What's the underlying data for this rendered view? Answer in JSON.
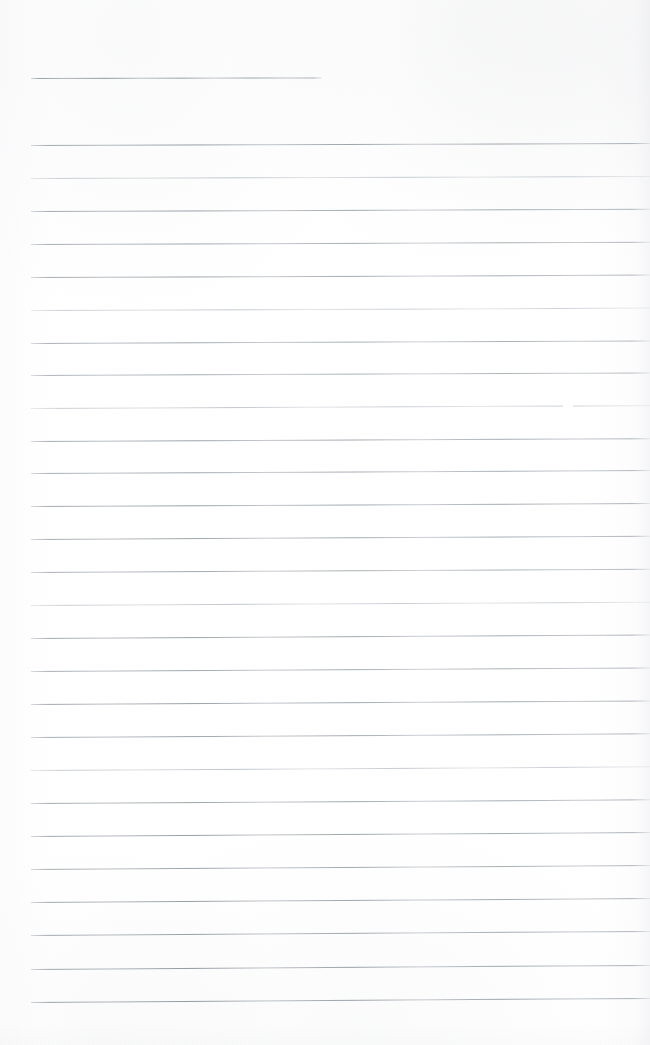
{
  "document": {
    "kind": "scanned-ruled-notebook-page",
    "title": "Blank Ruled Notebook Page",
    "page_width": 650,
    "page_height": 1045,
    "background_color": "#ffffff",
    "rule_color": "#9aa1aa",
    "left_margin_x": 31,
    "right_edge_x": 650,
    "written_text": "",
    "visible_text_content": "none"
  },
  "rules": [
    {
      "top": 78,
      "left": 31,
      "width": 291,
      "skew": -0.1,
      "opacity": 0.95,
      "faint": false
    },
    {
      "top": 145,
      "left": 31,
      "width": 619,
      "skew": -0.18,
      "opacity": 0.92,
      "faint": false
    },
    {
      "top": 178,
      "left": 31,
      "width": 619,
      "skew": -0.18,
      "opacity": 0.8,
      "faint": true
    },
    {
      "top": 211,
      "left": 31,
      "width": 619,
      "skew": -0.2,
      "opacity": 0.9,
      "faint": false
    },
    {
      "top": 244,
      "left": 31,
      "width": 619,
      "skew": -0.2,
      "opacity": 0.86,
      "faint": false
    },
    {
      "top": 277,
      "left": 31,
      "width": 619,
      "skew": -0.22,
      "opacity": 0.88,
      "faint": false
    },
    {
      "top": 310,
      "left": 31,
      "width": 619,
      "skew": -0.22,
      "opacity": 0.78,
      "faint": true
    },
    {
      "top": 343,
      "left": 31,
      "width": 619,
      "skew": -0.24,
      "opacity": 0.85,
      "faint": false
    },
    {
      "top": 375,
      "left": 31,
      "width": 619,
      "skew": -0.24,
      "opacity": 0.82,
      "faint": false
    },
    {
      "top": 408,
      "left": 31,
      "width": 619,
      "skew": -0.26,
      "opacity": 0.8,
      "faint": true
    },
    {
      "top": 441,
      "left": 31,
      "width": 619,
      "skew": -0.26,
      "opacity": 0.9,
      "faint": false
    },
    {
      "top": 473,
      "left": 31,
      "width": 619,
      "skew": -0.28,
      "opacity": 0.86,
      "faint": false
    },
    {
      "top": 506,
      "left": 31,
      "width": 619,
      "skew": -0.28,
      "opacity": 0.92,
      "faint": false
    },
    {
      "top": 539,
      "left": 31,
      "width": 619,
      "skew": -0.3,
      "opacity": 0.88,
      "faint": false
    },
    {
      "top": 572,
      "left": 31,
      "width": 619,
      "skew": -0.3,
      "opacity": 0.84,
      "faint": false
    },
    {
      "top": 605,
      "left": 31,
      "width": 619,
      "skew": -0.3,
      "opacity": 0.8,
      "faint": true
    },
    {
      "top": 638,
      "left": 31,
      "width": 619,
      "skew": -0.32,
      "opacity": 0.9,
      "faint": false
    },
    {
      "top": 671,
      "left": 31,
      "width": 619,
      "skew": -0.32,
      "opacity": 0.86,
      "faint": false
    },
    {
      "top": 704,
      "left": 31,
      "width": 619,
      "skew": -0.32,
      "opacity": 0.92,
      "faint": false
    },
    {
      "top": 737,
      "left": 31,
      "width": 619,
      "skew": -0.34,
      "opacity": 0.88,
      "faint": false
    },
    {
      "top": 770,
      "left": 31,
      "width": 619,
      "skew": -0.34,
      "opacity": 0.84,
      "faint": true
    },
    {
      "top": 803,
      "left": 31,
      "width": 619,
      "skew": -0.34,
      "opacity": 0.9,
      "faint": false
    },
    {
      "top": 836,
      "left": 31,
      "width": 619,
      "skew": -0.36,
      "opacity": 0.93,
      "faint": false
    },
    {
      "top": 869,
      "left": 31,
      "width": 619,
      "skew": -0.36,
      "opacity": 0.88,
      "faint": false
    },
    {
      "top": 902,
      "left": 31,
      "width": 619,
      "skew": -0.36,
      "opacity": 0.92,
      "faint": false
    },
    {
      "top": 935,
      "left": 31,
      "width": 619,
      "skew": -0.38,
      "opacity": 0.9,
      "faint": false
    },
    {
      "top": 969,
      "left": 31,
      "width": 619,
      "skew": -0.38,
      "opacity": 0.94,
      "faint": false
    },
    {
      "top": 1002,
      "left": 31,
      "width": 619,
      "skew": -0.38,
      "opacity": 0.95,
      "faint": false
    }
  ],
  "artifacts": [
    {
      "name": "scan-dropout",
      "top": 372,
      "left": 69,
      "width": 7
    },
    {
      "name": "scan-dropout",
      "top": 405,
      "left": 563,
      "width": 10
    },
    {
      "name": "scan-dropout",
      "top": 142,
      "left": 205,
      "width": 5
    }
  ]
}
